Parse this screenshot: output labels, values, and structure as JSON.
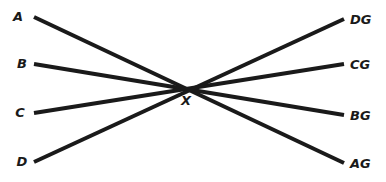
{
  "diagram": {
    "line_color": "#1a1a1a",
    "center": {
      "label": "X",
      "x": 191,
      "y": 88,
      "label_x": 182,
      "label_y": 104
    },
    "left_points": [
      {
        "label": "A",
        "x": 34,
        "y": 17
      },
      {
        "label": "B",
        "x": 34,
        "y": 64
      },
      {
        "label": "C",
        "x": 34,
        "y": 113
      },
      {
        "label": "D",
        "x": 34,
        "y": 162
      }
    ],
    "right_points": [
      {
        "label": "DG",
        "x": 344,
        "y": 19
      },
      {
        "label": "CG",
        "x": 344,
        "y": 64
      },
      {
        "label": "BG",
        "x": 344,
        "y": 115
      },
      {
        "label": "AG",
        "x": 344,
        "y": 163
      }
    ],
    "lines": [
      {
        "from": "A",
        "to": "AG"
      },
      {
        "from": "B",
        "to": "BG"
      },
      {
        "from": "C",
        "to": "CG"
      },
      {
        "from": "D",
        "to": "DG"
      }
    ]
  }
}
